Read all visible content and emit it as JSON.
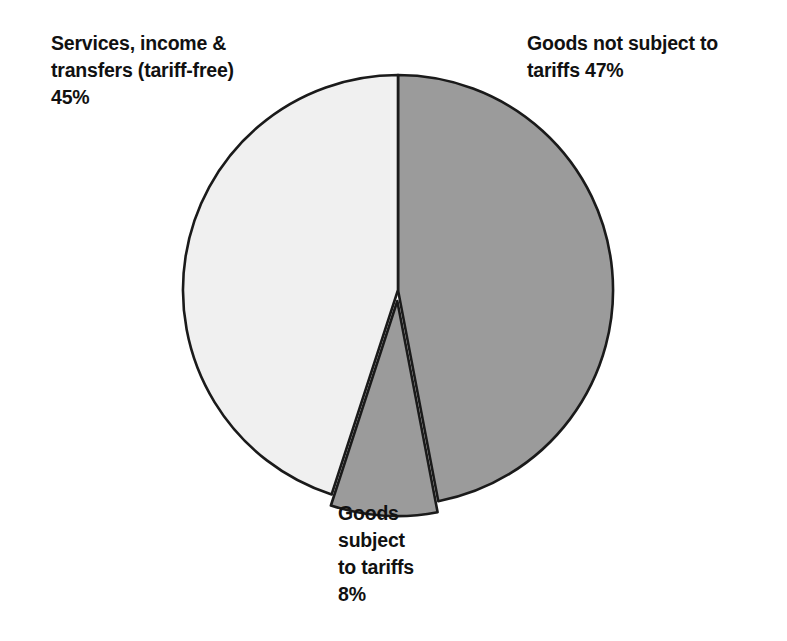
{
  "chart_data": {
    "type": "pie",
    "title": "",
    "subtitle": "",
    "xlabel": "",
    "ylabel": "",
    "legend_position": "none",
    "grid": false,
    "units": "percent",
    "total": 100,
    "start_angle_deg": 0,
    "direction": "clockwise",
    "categories": [
      "Goods not subject to tariffs",
      "Goods subject to tariffs",
      "Services, income & transfers (tariff-free)"
    ],
    "values": [
      47,
      8,
      45
    ],
    "slices": [
      {
        "name": "goods-not-subject-to-tariffs",
        "label": "Goods not subject to tariffs 47%",
        "category": "Goods not subject to tariffs",
        "value": 47,
        "value_text": "47%",
        "color": "#9b9b9b",
        "start_angle_deg": 0,
        "end_angle_deg": 169.2,
        "exploded": false
      },
      {
        "name": "goods-subject-to-tariffs",
        "label": "Goods subject to tariffs 8%",
        "category": "Goods subject to tariffs",
        "value": 8,
        "value_text": "8%",
        "color": "#9b9b9b",
        "start_angle_deg": 169.2,
        "end_angle_deg": 198.0,
        "exploded": true
      },
      {
        "name": "services-income-transfers",
        "label": "Services, income & transfers (tariff-free) 45%",
        "category": "Services, income & transfers (tariff-free)",
        "value": 45,
        "value_text": "45%",
        "color": "#f0f0f0",
        "start_angle_deg": 198.0,
        "end_angle_deg": 360,
        "exploded": false
      }
    ],
    "annotations": [
      "Services, income & transfers (tariff-free) 45%",
      "Goods not subject to tariffs 47%",
      "Goods subject to tariffs 8%"
    ],
    "colors": {
      "slice_dark": "#9b9b9b",
      "slice_light": "#f0f0f0",
      "outline": "#1a1a1a",
      "background": "#ffffff",
      "text": "#111111"
    }
  },
  "labels": {
    "services": "Services, income &\ntransfers (tariff-free)\n45%",
    "goods_not_subject": "Goods not subject to\ntariffs 47%",
    "goods_subject": "Goods\nsubject\nto tariffs\n8%"
  }
}
